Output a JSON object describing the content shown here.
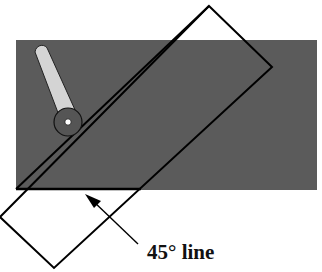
{
  "figure": {
    "label": "45° line",
    "colors": {
      "background": "#ffffff",
      "plate": "#5b5b5b",
      "outline": "#000000",
      "arm": "#d4d4d4",
      "pivot": "#555555",
      "pivot_center": "#ffffff"
    },
    "plate_rect": {
      "x": 16,
      "y": 40,
      "width": 301,
      "height": 150
    },
    "rotated_rect_corners": [
      [
        209,
        6
      ],
      [
        272,
        67
      ],
      [
        54,
        268
      ],
      [
        0,
        217
      ]
    ],
    "pivot": {
      "cx": 68,
      "cy": 122,
      "r": 14
    },
    "arrow": {
      "from": [
        138,
        244
      ],
      "to": [
        87,
        195
      ]
    }
  }
}
